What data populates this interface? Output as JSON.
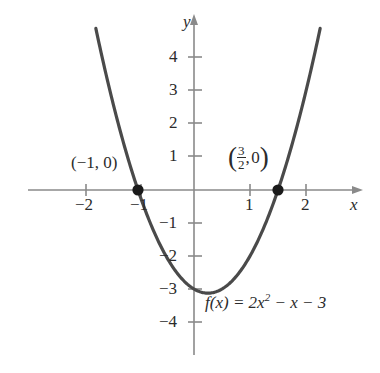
{
  "chart_data": {
    "type": "line",
    "title": "",
    "subtitle": "",
    "function_label": "f(x) = 2x² − x − 3",
    "equation_parts": {
      "lhs": "f",
      "lhs_arg_open": "(",
      "lhs_var": "x",
      "lhs_arg_close": ")",
      "equals": "=",
      "coef": "2",
      "var1": "x",
      "exponent": "2",
      "minus1": "−",
      "var2": "x",
      "minus2": "−",
      "constant": "3"
    },
    "xlabel": "x",
    "ylabel": "y",
    "xlim": [
      -2.6,
      3.0
    ],
    "ylim": [
      -5.0,
      4.9
    ],
    "grid": false,
    "legend": "none",
    "x_ticks": [
      -2,
      -1,
      1,
      2
    ],
    "x_tick_labels": [
      "−2",
      "−1",
      "1",
      "2"
    ],
    "y_ticks": [
      -4,
      -3,
      -2,
      -1,
      1,
      2,
      3,
      4
    ],
    "y_tick_labels": [
      "−4",
      "−3",
      "−2",
      "−1",
      "1",
      "2",
      "3",
      "4"
    ],
    "series": [
      {
        "name": "f(x) = 2x^2 - x - 3",
        "type": "parabola",
        "a": 2,
        "b": -1,
        "c": -3,
        "vertex": [
          0.25,
          -3.125
        ],
        "color": "#4a4a4a"
      }
    ],
    "points": [
      {
        "name": "x-intercept-left",
        "x": -1,
        "y": 0,
        "label": "(−1, 0)"
      },
      {
        "name": "x-intercept-right",
        "x": 1.5,
        "y": 0,
        "label": "(3/2, 0)"
      }
    ],
    "annotations": [
      {
        "name": "left-intercept-label",
        "text": "(−1, 0)",
        "open_paren": "(",
        "x_value": "−1,",
        "y_value": "0",
        "close_paren": ")"
      },
      {
        "name": "right-intercept-label",
        "open_paren": "(",
        "numerator": "3",
        "denominator": "2",
        "comma": ",",
        "y_value": "0",
        "close_paren": ")"
      },
      {
        "name": "function-equation",
        "text": "f(x) = 2x² − x − 3"
      }
    ],
    "colors": {
      "curve": "#4a4a4a",
      "axis": "#8a8a8a",
      "point": "#1a1a1a",
      "text": "#2b2b2b",
      "background": "#ffffff"
    }
  }
}
